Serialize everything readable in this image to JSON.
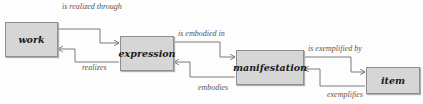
{
  "entities": [
    {
      "id": "work",
      "label": "work"
    },
    {
      "id": "expression",
      "label": "expression"
    },
    {
      "id": "manifestation",
      "label": "manifestation"
    },
    {
      "id": "item",
      "label": "item"
    }
  ],
  "relationships": [
    {
      "from": "work",
      "to": "expression",
      "label": "is realized through"
    },
    {
      "from": "expression",
      "to": "work",
      "label": "realizes"
    },
    {
      "from": "expression",
      "to": "manifestation",
      "label": "is embodied in"
    },
    {
      "from": "manifestation",
      "to": "expression",
      "label": "embodies"
    },
    {
      "from": "manifestation",
      "to": "item",
      "label": "is exemplified by"
    },
    {
      "from": "item",
      "to": "manifestation",
      "label": "exemplifies"
    }
  ],
  "colors": {
    "box_fill": "#d6d6d6",
    "box_border": "#8e8e8e",
    "line": "#7a7a7a"
  }
}
